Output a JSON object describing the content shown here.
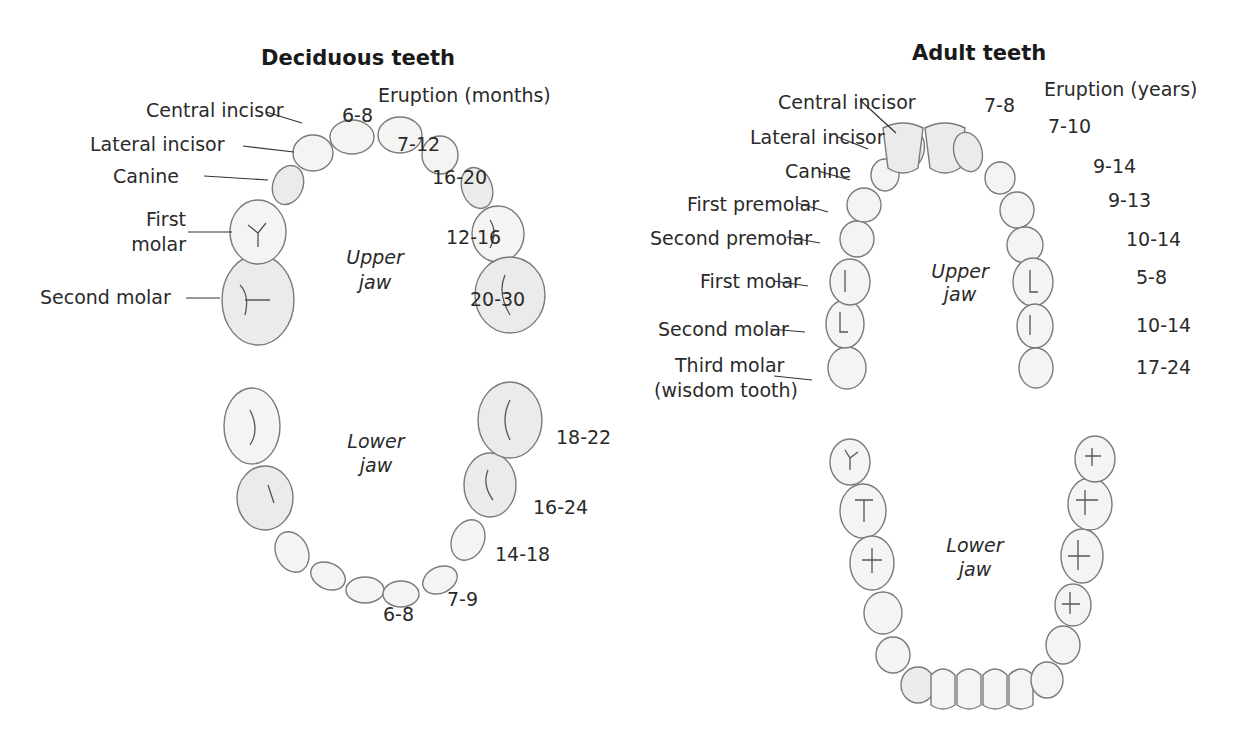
{
  "deciduous": {
    "title": "Deciduous teeth",
    "eruption_header": "Eruption (months)",
    "upper_jaw_label": [
      "Upper",
      "jaw"
    ],
    "lower_jaw_label": [
      "Lower",
      "jaw"
    ],
    "labels": {
      "central_incisor": "Central incisor",
      "lateral_incisor": "Lateral incisor",
      "canine": "Canine",
      "first_molar": [
        "First",
        "molar"
      ],
      "second_molar": "Second molar"
    },
    "upper_eruption": [
      "6-8",
      "7-12",
      "16-20",
      "12-16",
      "20-30"
    ],
    "lower_eruption": [
      "18-22",
      "16-24",
      "14-18",
      "7-9",
      "6-8"
    ]
  },
  "adult": {
    "title": "Adult teeth",
    "eruption_header": "Eruption (years)",
    "upper_jaw_label": [
      "Upper",
      "jaw"
    ],
    "lower_jaw_label": [
      "Lower",
      "jaw"
    ],
    "labels": {
      "central_incisor": "Central incisor",
      "lateral_incisor": "Lateral incisor",
      "canine": "Canine",
      "first_premolar": "First premolar",
      "second_premolar": "Second premolar",
      "first_molar": "First molar",
      "second_molar": "Second molar",
      "third_molar": [
        "Third molar",
        "(wisdom tooth)"
      ]
    },
    "upper_eruption": [
      "7-8",
      "7-10",
      "9-14",
      "9-13",
      "10-14",
      "5-8",
      "10-14",
      "17-24"
    ]
  }
}
